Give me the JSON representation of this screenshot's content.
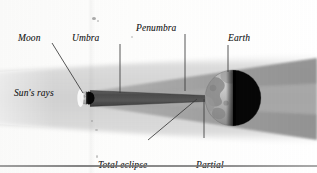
{
  "figure": {
    "kind": "solar-eclipse-diagram",
    "labels": {
      "moon": "Moon",
      "umbra": "Umbra",
      "penumbra": "Penumbra",
      "earth": "Earth",
      "suns_rays": "Sun's rays",
      "total_eclipse_line1": "Total eclipse",
      "total_eclipse_line2": "seen",
      "partial_eclipse_line1": "Partial",
      "partial_eclipse_line2": "eclipse seen"
    },
    "colors": {
      "paper": "#fdfdfd",
      "sunlight_band": "#d9d9d9",
      "penumbra": "#9d9d9d",
      "umbra": "#4a4a4a",
      "moon_lit": "#b9b9b9",
      "moon_shadow": "#0a0a0a",
      "earth_lit": "#a9a9a9",
      "earth_night": "#090909",
      "leader_line": "#3a3a3a",
      "rule": "#7b7b7b",
      "label_text": "#242424"
    },
    "bodies": {
      "moon": {
        "cx": 86,
        "cy": 98,
        "r": 6
      },
      "earth": {
        "cx": 233,
        "cy": 98,
        "r": 28
      }
    },
    "leaders": [
      {
        "name": "moon-leader",
        "x1": 52,
        "y1": 43,
        "x2": 83,
        "y2": 93
      },
      {
        "name": "umbra-leader",
        "x1": 120,
        "y1": 44,
        "x2": 120,
        "y2": 93
      },
      {
        "name": "penumbra-leader",
        "x1": 185,
        "y1": 34,
        "x2": 185,
        "y2": 91
      },
      {
        "name": "earth-leader",
        "x1": 228,
        "y1": 45,
        "x2": 228,
        "y2": 72
      },
      {
        "name": "total-leader",
        "x1": 148,
        "y1": 140,
        "x2": 197,
        "y2": 99
      },
      {
        "name": "partial-leader",
        "x1": 204,
        "y1": 138,
        "x2": 204,
        "y2": 99
      }
    ]
  }
}
